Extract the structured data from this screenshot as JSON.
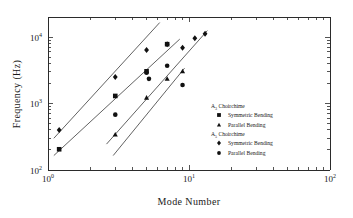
{
  "chart_data": {
    "type": "scatter",
    "title": "",
    "xlabel": "Mode Number",
    "ylabel": "Frequency (Hz)",
    "xscale": "log",
    "yscale": "log",
    "xlim": [
      1,
      100
    ],
    "ylim": [
      100,
      20000
    ],
    "grid": false,
    "legend_position": "right-middle",
    "xticklabels": [
      "10⁰",
      "10¹",
      "10²"
    ],
    "xtickvalues": [
      1,
      10,
      100
    ],
    "yticklabels": [
      "10²",
      "10³",
      "10⁴"
    ],
    "ytickvalues": [
      100,
      1000,
      10000
    ],
    "series": [
      {
        "name": "A3 Choirchime Symmetric Bending",
        "group": "A₃ Choirchime",
        "mode": "Symmetric Bending",
        "marker": "square",
        "x": [
          1.2,
          3.0,
          5.0,
          7.0
        ],
        "y": [
          205,
          1300,
          3050,
          7800
        ]
      },
      {
        "name": "A3 Choirchime Parallel Bending",
        "group": "A₃ Choirchime",
        "mode": "Parallel Bending",
        "marker": "triangle",
        "x": [
          3.0,
          5.0,
          7.0,
          9.0
        ],
        "y": [
          340,
          1220,
          2350,
          3050
        ]
      },
      {
        "name": "A5 Choirchime Symmetric Bending",
        "group": "A₅ Choirchime",
        "mode": "Symmetric Bending",
        "marker": "diamond",
        "x": [
          1.2,
          3.0,
          5.0,
          7.0,
          9.0,
          11.0,
          13.0
        ],
        "y": [
          400,
          2500,
          6400,
          7800,
          6900,
          9600,
          11200
        ]
      },
      {
        "name": "A5 Choirchime Parallel Bending",
        "group": "A₅ Choirchime",
        "mode": "Parallel Bending",
        "marker": "circle",
        "x": [
          3.0,
          5.0,
          5.2,
          7.0,
          9.0
        ],
        "y": [
          680,
          2900,
          2350,
          3700,
          1900
        ]
      }
    ],
    "fit_lines": [
      {
        "name": "fit-upper",
        "x1": 1.1,
        "y1": 300,
        "x2": 6.2,
        "y2": 16500
      },
      {
        "name": "fit-second",
        "x1": 1.1,
        "y1": 165,
        "x2": 8.6,
        "y2": 9300
      },
      {
        "name": "fit-third",
        "x1": 2.6,
        "y1": 245,
        "x2": 13.5,
        "y2": 12500
      },
      {
        "name": "fit-lower",
        "x1": 2.9,
        "y1": 165,
        "x2": 9.3,
        "y2": 3400
      }
    ]
  },
  "legend": {
    "groups": [
      {
        "header_base": "A",
        "header_sub": "3",
        "header_rest": " Choirchime",
        "entries": [
          {
            "marker": "square",
            "label": "Symmetric Bending"
          },
          {
            "marker": "triangle",
            "label": "Parallel Bending"
          }
        ]
      },
      {
        "header_base": "A",
        "header_sub": "5",
        "header_rest": " Choirchime",
        "entries": [
          {
            "marker": "diamond",
            "label": "Symmetric Bending"
          },
          {
            "marker": "circle",
            "label": "Parallel Bending"
          }
        ]
      }
    ]
  },
  "axes": {
    "x_title": "Mode Number",
    "y_title": "Frequency (Hz)",
    "x_labels": [
      {
        "base": "10",
        "exp": "0"
      },
      {
        "base": "10",
        "exp": "1"
      },
      {
        "base": "10",
        "exp": "2"
      }
    ],
    "y_labels": [
      {
        "base": "10",
        "exp": "2"
      },
      {
        "base": "10",
        "exp": "3"
      },
      {
        "base": "10",
        "exp": "4"
      }
    ]
  },
  "colors": {
    "axis": "#2b2b2b",
    "marker": "#111111",
    "line": "#3a3a3a",
    "background": "#ffffff"
  }
}
